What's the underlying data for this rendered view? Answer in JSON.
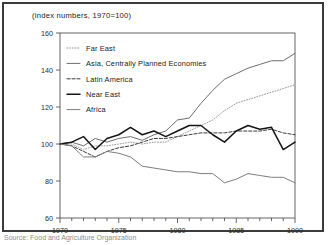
{
  "figure": {
    "title": "(index numbers, 1970=100)",
    "source_note": "Source: Food and Agriculture Organization"
  },
  "colors": {
    "frame": "#3b3b3b",
    "axis": "#555555",
    "far_east": "#9a9a9a",
    "asia_cpe": "#6e6e6e",
    "latin_america": "#3a3a3a",
    "near_east": "#151515",
    "africa": "#7d7d7d",
    "text": "#1a1a1a",
    "background": "#ffffff"
  },
  "legend": {
    "items": [
      {
        "label": "Far East",
        "style": "dotted",
        "color": "#9a9a9a"
      },
      {
        "label": "Asia, Centrally Planned Economies",
        "style": "solid",
        "color": "#6e6e6e"
      },
      {
        "label": "Latin America",
        "style": "dashed",
        "color": "#3a3a3a"
      },
      {
        "label": "Near East",
        "style": "solid",
        "color": "#151515"
      },
      {
        "label": "Africa",
        "style": "solid",
        "color": "#7d7d7d"
      }
    ]
  },
  "chart_data": {
    "type": "line",
    "title": "(index numbers, 1970=100)",
    "xlabel": "",
    "ylabel": "",
    "xlim": [
      1970,
      1990
    ],
    "ylim": [
      60,
      160
    ],
    "yticks": [
      60,
      80,
      100,
      120,
      140,
      160
    ],
    "xticks": [
      1970,
      1975,
      1980,
      1985,
      1990
    ],
    "xtick_labels": [
      "1970",
      "1975",
      "1980",
      "1985",
      "1990"
    ],
    "ytick_labels": [
      "60",
      "80",
      "100",
      "120",
      "140",
      "160"
    ],
    "minor_xticks_every": 1,
    "grid": false,
    "legend_position": "upper-left-inside",
    "x": [
      1970,
      1971,
      1972,
      1973,
      1974,
      1975,
      1976,
      1977,
      1978,
      1979,
      1980,
      1981,
      1982,
      1983,
      1984,
      1985,
      1986,
      1987,
      1988,
      1989,
      1990
    ],
    "series": [
      {
        "name": "Far East",
        "style": "dotted",
        "color": "#9a9a9a",
        "values": [
          100,
          100,
          97,
          99,
          99,
          100,
          101,
          100,
          101,
          101,
          104,
          107,
          110,
          113,
          118,
          122,
          124,
          126,
          128,
          130,
          132
        ]
      },
      {
        "name": "Asia, Centrally Planned Economies",
        "style": "solid",
        "color": "#6e6e6e",
        "values": [
          100,
          101,
          99,
          103,
          101,
          103,
          104,
          102,
          105,
          107,
          113,
          114,
          122,
          129,
          135,
          138,
          141,
          143,
          145,
          145,
          149
        ]
      },
      {
        "name": "Latin America",
        "style": "dashed",
        "color": "#3a3a3a",
        "values": [
          100,
          99,
          96,
          93,
          96,
          98,
          99,
          101,
          103,
          103,
          104,
          105,
          106,
          106,
          106,
          107,
          107,
          107,
          108,
          106,
          105
        ]
      },
      {
        "name": "Near East",
        "style": "solid",
        "color": "#151515",
        "values": [
          100,
          101,
          104,
          97,
          103,
          105,
          109,
          105,
          107,
          104,
          107,
          110,
          110,
          105,
          101,
          107,
          110,
          108,
          109,
          97,
          101
        ]
      },
      {
        "name": "Africa",
        "style": "solid",
        "color": "#7d7d7d",
        "values": [
          100,
          99,
          93,
          93,
          96,
          95,
          93,
          88,
          87,
          86,
          85,
          85,
          84,
          84,
          79,
          81,
          84,
          83,
          82,
          82,
          79
        ]
      }
    ]
  }
}
